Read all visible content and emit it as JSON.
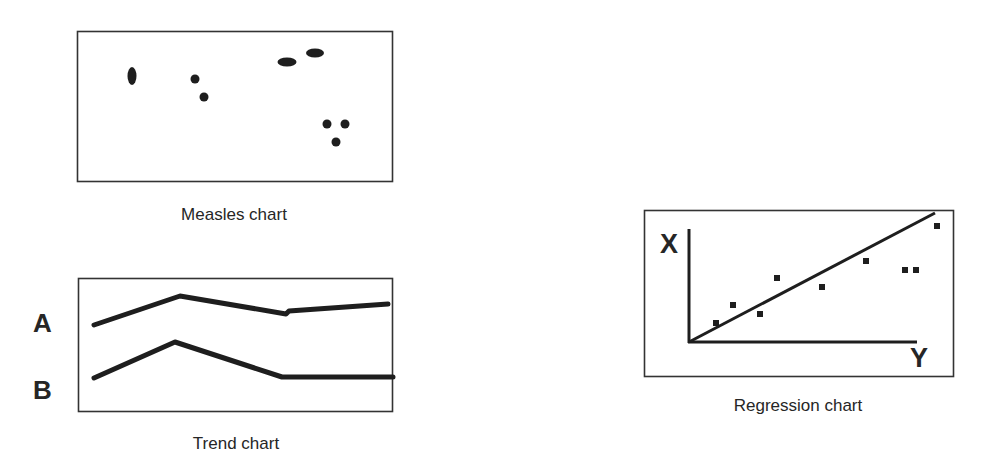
{
  "colors": {
    "ink": "#1e1e1e",
    "frame": "#333333",
    "background": "#ffffff"
  },
  "chart_data": [
    {
      "type": "scatter",
      "title": "Measles chart",
      "xlabel": "",
      "ylabel": "",
      "grid": false,
      "points": [
        {
          "cx": 132,
          "cy": 76,
          "rx": 4.5,
          "ry": 9
        },
        {
          "cx": 195,
          "cy": 79,
          "rx": 4.5,
          "ry": 4.5
        },
        {
          "cx": 204,
          "cy": 97,
          "rx": 4.5,
          "ry": 4.5
        },
        {
          "cx": 287,
          "cy": 62,
          "rx": 9.5,
          "ry": 4.5
        },
        {
          "cx": 315,
          "cy": 53,
          "rx": 9,
          "ry": 4.5
        },
        {
          "cx": 327,
          "cy": 124,
          "rx": 4.5,
          "ry": 4.5
        },
        {
          "cx": 345,
          "cy": 124,
          "rx": 4.5,
          "ry": 4.5
        },
        {
          "cx": 336,
          "cy": 142,
          "rx": 4.5,
          "ry": 4.5
        }
      ]
    },
    {
      "type": "line",
      "title": "Trend chart",
      "xlabel": "",
      "ylabel": "",
      "grid": false,
      "series": [
        {
          "name": "A",
          "points": [
            [
              94,
              325
            ],
            [
              180,
              296
            ],
            [
              286,
              314
            ],
            [
              289,
              311
            ],
            [
              388,
              304
            ]
          ]
        },
        {
          "name": "B",
          "points": [
            [
              94,
              378
            ],
            [
              175,
              342
            ],
            [
              282,
              377
            ],
            [
              393,
              377
            ]
          ]
        }
      ]
    },
    {
      "type": "scatter",
      "title": "Regression chart",
      "xlabel": "Y",
      "ylabel": "X",
      "grid": false,
      "trendline": {
        "x1": 689,
        "y1": 342,
        "x2": 935,
        "y2": 213
      },
      "points": [
        [
          716,
          323
        ],
        [
          733,
          305
        ],
        [
          760,
          314
        ],
        [
          777,
          278
        ],
        [
          822,
          287
        ],
        [
          866,
          261
        ],
        [
          905,
          270
        ],
        [
          916,
          270
        ],
        [
          937,
          226
        ]
      ]
    }
  ],
  "diagram": {
    "measles": {
      "caption": "Measles chart"
    },
    "trend": {
      "caption": "Trend chart",
      "series_labels": [
        "A",
        "B"
      ]
    },
    "regression": {
      "caption": "Regression chart",
      "axis_x_label": "X",
      "axis_y_label": "Y"
    }
  }
}
